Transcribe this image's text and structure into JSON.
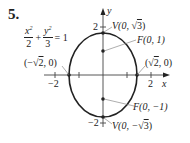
{
  "problem": {
    "number": "5.",
    "equation": {
      "term1_num": "x",
      "term1_den": "2",
      "plus": "+",
      "term2_num": "y",
      "term2_den": "3",
      "equals": "= 1",
      "exp": "2"
    }
  },
  "axes": {
    "x_label": "x",
    "y_label": "y",
    "x_ticks": {
      "neg": "−2",
      "pos": "2"
    },
    "y_ticks": {
      "pos": "2",
      "neg": "−2"
    }
  },
  "points": {
    "vertex_top": {
      "prefix": "V(0, ",
      "root": "3",
      "suffix": ")",
      "sign": ""
    },
    "vertex_bottom": {
      "prefix": "V(0, −",
      "root": "3",
      "suffix": ")"
    },
    "focus_top": "F(0, 1)",
    "focus_bottom": "F(0, −1)",
    "x_int_right": {
      "prefix": "(",
      "root": "2",
      "suffix": ", 0)"
    },
    "x_int_left": {
      "prefix": "(−",
      "root": "2",
      "suffix": ", 0)"
    }
  },
  "colors": {
    "ink": "#222222",
    "axis": "#444444",
    "leader": "#777777"
  }
}
